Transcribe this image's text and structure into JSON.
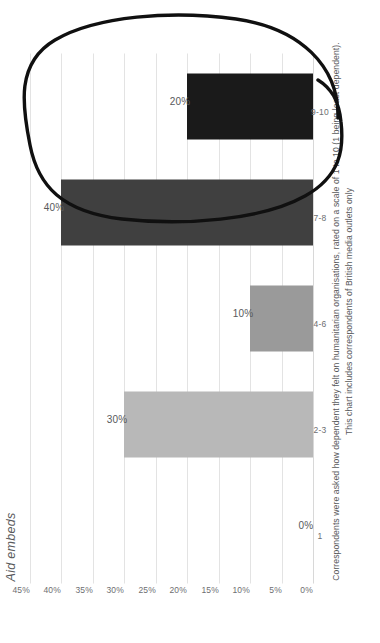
{
  "chart_data": {
    "type": "bar",
    "orientation": "horizontal",
    "title": "Aid embeds",
    "xlabel": "",
    "ylabel": "",
    "categories": [
      "1",
      "2-3",
      "4-6",
      "7-8",
      "9-10"
    ],
    "values": [
      0,
      30,
      10,
      40,
      20
    ],
    "value_labels": [
      "0%",
      "30%",
      "10%",
      "40%",
      "20%"
    ],
    "bar_colors": [
      "#b8b8b8",
      "#b8b8b8",
      "#9a9a9a",
      "#404040",
      "#1a1a1a"
    ],
    "ylim": [
      0,
      45
    ],
    "tick_labels": [
      "0%",
      "5%",
      "10%",
      "15%",
      "20%",
      "25%",
      "30%",
      "35%",
      "40%",
      "45%"
    ],
    "tick_values": [
      0,
      5,
      10,
      15,
      20,
      25,
      30,
      35,
      40,
      45
    ],
    "grid": true,
    "legend": "none",
    "annotations": [
      {
        "name": "hand-drawn-ellipse",
        "shape": "ellipse",
        "encircles": [
          "7-8",
          "9-10"
        ],
        "color": "#101010"
      }
    ]
  },
  "footnotes": {
    "line1": "Correspondents were asked how dependent they felt on humanitarian organisations, rated on a scale of 1 to 10 (1 being least dependent).",
    "line2": "This chart includes correspondents of British media outlets only"
  },
  "colors": {
    "gridline": "#e3e3e3",
    "text": "#58595b",
    "tick_text": "#6d6e71",
    "annotation": "#101010",
    "background": "#ffffff"
  }
}
